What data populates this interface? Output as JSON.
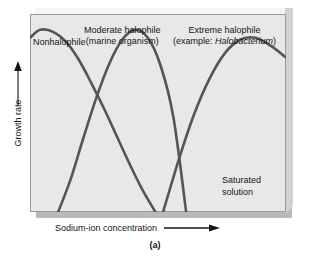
{
  "figure": {
    "caption": "(a)",
    "panel_bg_color": "#e8e8e8",
    "curve_color": "#555555",
    "page_bg_color": "#ffffff"
  },
  "axes": {
    "y_label": "Growth rate",
    "y_arrow_icon": "arrow-up-icon",
    "x_label": "Sodium-ion concentration",
    "x_arrow_icon": "arrow-right-icon"
  },
  "annotations": {
    "nonhalophile": "Nonhalophile",
    "moderate_line1": "Moderate halophile",
    "moderate_line2": "(marine organism)",
    "extreme_line1": "Extreme  halophile",
    "extreme_line2_prefix": "(example: ",
    "extreme_line2_species": "Halobacterium",
    "extreme_line2_suffix": ")",
    "saturated_line1": "Saturated",
    "saturated_line2": "solution"
  },
  "chart_data": {
    "type": "line",
    "title": "",
    "xlabel": "Sodium-ion concentration",
    "ylabel": "Growth rate",
    "xlim": [
      0,
      100
    ],
    "ylim": [
      0,
      100
    ],
    "grid": false,
    "legend": "none",
    "axis_ticks": "none",
    "series": [
      {
        "name": "Nonhalophile",
        "color": "#555555",
        "x": [
          0,
          4,
          9,
          14,
          19,
          24,
          29,
          34,
          39,
          44,
          49
        ],
        "y": [
          88,
          92,
          91,
          86,
          77,
          65,
          52,
          38,
          24,
          11,
          0
        ]
      },
      {
        "name": "Moderate halophile (marine organism)",
        "color": "#555555",
        "x": [
          11,
          16,
          21,
          26,
          31,
          36,
          41,
          46,
          51,
          56,
          61
        ],
        "y": [
          0,
          17,
          38,
          58,
          75,
          87,
          92,
          88,
          74,
          48,
          0
        ]
      },
      {
        "name": "Extreme halophile (example: Halobacterium)",
        "color": "#555555",
        "x": [
          52,
          58,
          64,
          70,
          76,
          82,
          88,
          94,
          100
        ],
        "y": [
          0,
          26,
          49,
          67,
          80,
          87,
          88,
          84,
          78
        ]
      }
    ]
  }
}
